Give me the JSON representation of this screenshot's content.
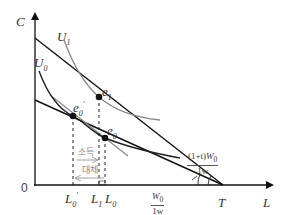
{
  "diagram": {
    "axes": {
      "y_label": "C",
      "x_label": "L",
      "origin_label": "0",
      "endpoint_label": "T"
    },
    "curves": {
      "u0_label": "U",
      "u0_sub": "0",
      "u1_label": "U",
      "u1_sub": "1"
    },
    "points": {
      "e1_label": "e",
      "e1_sub": "1",
      "e0_label": "e",
      "e0_sub": "0",
      "e0p_label": "e",
      "e0p_sub": "0",
      "e0p_prime": "′"
    },
    "ticks": {
      "l0p_label": "L",
      "l0p_sub": "0",
      "l0p_prime": "′",
      "l1_label": "L",
      "l1_sub": "1",
      "l0_label": "L",
      "l0_sub": "0"
    },
    "effects": {
      "income_label": "소득",
      "substitution_label": "대체"
    },
    "slopes": {
      "w0_num": "W",
      "w0_num_sub": "0",
      "w0_den": "1w",
      "wt_num_prefix": "(1+t)",
      "wt_num": "W",
      "wt_num_sub": "0",
      "wt_den": "1w"
    },
    "colors": {
      "line": "#111111",
      "curve_dark": "#222222",
      "curve_grey": "#888888",
      "dashed": "#222222",
      "label": "#333333"
    }
  }
}
